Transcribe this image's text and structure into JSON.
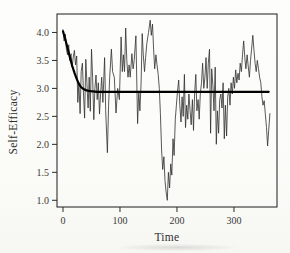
{
  "figure": {
    "xlabel": "Time",
    "ylabel": "Self-Efficacy"
  },
  "colors": {
    "background": "#fdfdfb",
    "frame": "#1d1d1d",
    "tick": "#2a2a2a",
    "text": "#3a3a3a",
    "observed_line": "#2e2e2e",
    "trend_line": "#000000"
  },
  "chart_data": {
    "type": "line",
    "title": "",
    "xlabel": "Time",
    "ylabel": "Self-Efficacy",
    "xlim": [
      -10.5,
      375.5
    ],
    "ylim": [
      0.88,
      4.33
    ],
    "grid": false,
    "legend": null,
    "x_ticks": [
      {
        "v": 0,
        "label": "0"
      },
      {
        "v": 100,
        "label": "100"
      },
      {
        "v": 200,
        "label": "200"
      },
      {
        "v": 300,
        "label": "300"
      }
    ],
    "y_ticks": [
      {
        "v": 1.0,
        "label": "1.0"
      },
      {
        "v": 1.5,
        "label": "1.5"
      },
      {
        "v": 2.0,
        "label": "2.0"
      },
      {
        "v": 2.5,
        "label": "2.5"
      },
      {
        "v": 3.0,
        "label": "3.0"
      },
      {
        "v": 3.5,
        "label": "3.5"
      },
      {
        "v": 4.0,
        "label": "4.0"
      }
    ],
    "series": [
      {
        "name": "observed-self-efficacy",
        "style": "thin-jagged",
        "color": "#2e2e2e",
        "width": 0.8,
        "points": [
          [
            0,
            4.05
          ],
          [
            2,
            3.85
          ],
          [
            4,
            3.97
          ],
          [
            6,
            3.7
          ],
          [
            8,
            3.6
          ],
          [
            10,
            3.78
          ],
          [
            12,
            3.5
          ],
          [
            14,
            3.62
          ],
          [
            16,
            3.38
          ],
          [
            18,
            3.55
          ],
          [
            20,
            3.68
          ],
          [
            22,
            3.42
          ],
          [
            24,
            3.58
          ],
          [
            26,
            2.75
          ],
          [
            28,
            3.1
          ],
          [
            30,
            2.55
          ],
          [
            32,
            3.3
          ],
          [
            34,
            3.45
          ],
          [
            36,
            2.9
          ],
          [
            38,
            2.47
          ],
          [
            40,
            3.52
          ],
          [
            42,
            3.1
          ],
          [
            44,
            2.65
          ],
          [
            46,
            3.2
          ],
          [
            48,
            2.59
          ],
          [
            50,
            3.7
          ],
          [
            52,
            3.2
          ],
          [
            54,
            2.44
          ],
          [
            56,
            3.0
          ],
          [
            58,
            3.24
          ],
          [
            60,
            2.8
          ],
          [
            62,
            3.1
          ],
          [
            64,
            2.54
          ],
          [
            66,
            2.9
          ],
          [
            68,
            3.2
          ],
          [
            70,
            2.75
          ],
          [
            73,
            3.55
          ],
          [
            75,
            2.6
          ],
          [
            78,
            1.85
          ],
          [
            80,
            2.7
          ],
          [
            82,
            3.2
          ],
          [
            85,
            3.7
          ],
          [
            87,
            3.3
          ],
          [
            90,
            3.2
          ],
          [
            93,
            2.56
          ],
          [
            96,
            3.0
          ],
          [
            99,
            2.8
          ],
          [
            102,
            3.92
          ],
          [
            104,
            3.3
          ],
          [
            106,
            3.6
          ],
          [
            108,
            3.3
          ],
          [
            110,
            4.08
          ],
          [
            112,
            3.5
          ],
          [
            114,
            3.2
          ],
          [
            116,
            3.42
          ],
          [
            118,
            3.2
          ],
          [
            121,
            3.62
          ],
          [
            123,
            3.35
          ],
          [
            125,
            3.5
          ],
          [
            128,
            3.94
          ],
          [
            131,
            2.37
          ],
          [
            133,
            2.95
          ],
          [
            135,
            2.6
          ],
          [
            137,
            3.1
          ],
          [
            139,
            3.98
          ],
          [
            141,
            3.6
          ],
          [
            143,
            3.3
          ],
          [
            145,
            3.55
          ],
          [
            147,
            3.8
          ],
          [
            150,
            4.0
          ],
          [
            153,
            4.22
          ],
          [
            155,
            3.95
          ],
          [
            157,
            4.15
          ],
          [
            159,
            3.7
          ],
          [
            161,
            3.35
          ],
          [
            163,
            3.6
          ],
          [
            165,
            3.42
          ],
          [
            167,
            3.25
          ],
          [
            169,
            3.0
          ],
          [
            171,
            2.55
          ],
          [
            173,
            1.9
          ],
          [
            175,
            1.55
          ],
          [
            177,
            1.78
          ],
          [
            179,
            1.35
          ],
          [
            181,
            1.15
          ],
          [
            183,
            1.0
          ],
          [
            185,
            1.5
          ],
          [
            187,
            1.22
          ],
          [
            189,
            1.65
          ],
          [
            191,
            1.45
          ],
          [
            193,
            2.1
          ],
          [
            195,
            1.8
          ],
          [
            197,
            2.45
          ],
          [
            199,
            2.7
          ],
          [
            201,
            2.95
          ],
          [
            203,
            3.15
          ],
          [
            205,
            2.7
          ],
          [
            207,
            2.4
          ],
          [
            209,
            2.85
          ],
          [
            211,
            2.5
          ],
          [
            213,
            3.25
          ],
          [
            215,
            2.3
          ],
          [
            217,
            2.7
          ],
          [
            219,
            2.45
          ],
          [
            221,
            2.9
          ],
          [
            223,
            2.6
          ],
          [
            225,
            2.35
          ],
          [
            227,
            2.8
          ],
          [
            229,
            2.25
          ],
          [
            231,
            2.9
          ],
          [
            233,
            3.25
          ],
          [
            235,
            2.6
          ],
          [
            237,
            2.8
          ],
          [
            239,
            2.45
          ],
          [
            241,
            2.9
          ],
          [
            243,
            3.1
          ],
          [
            245,
            3.45
          ],
          [
            247,
            3.0
          ],
          [
            249,
            3.2
          ],
          [
            251,
            3.55
          ],
          [
            253,
            3.0
          ],
          [
            255,
            3.45
          ],
          [
            257,
            3.7
          ],
          [
            259,
            2.2
          ],
          [
            261,
            3.35
          ],
          [
            263,
            3.05
          ],
          [
            265,
            2.6
          ],
          [
            267,
            3.38
          ],
          [
            269,
            2.0
          ],
          [
            271,
            2.6
          ],
          [
            273,
            2.2
          ],
          [
            275,
            2.8
          ],
          [
            277,
            2.9
          ],
          [
            279,
            2.65
          ],
          [
            281,
            3.1
          ],
          [
            283,
            2.1
          ],
          [
            285,
            2.7
          ],
          [
            287,
            2.15
          ],
          [
            289,
            2.85
          ],
          [
            291,
            3.0
          ],
          [
            293,
            2.7
          ],
          [
            295,
            3.1
          ],
          [
            297,
            2.9
          ],
          [
            299,
            3.2
          ],
          [
            301,
            3.0
          ],
          [
            303,
            3.33
          ],
          [
            305,
            3.1
          ],
          [
            307,
            3.27
          ],
          [
            309,
            3.15
          ],
          [
            311,
            3.45
          ],
          [
            313,
            3.3
          ],
          [
            315,
            3.6
          ],
          [
            317,
            3.85
          ],
          [
            319,
            3.55
          ],
          [
            321,
            3.35
          ],
          [
            323,
            3.6
          ],
          [
            325,
            3.4
          ],
          [
            327,
            3.2
          ],
          [
            329,
            3.5
          ],
          [
            331,
            3.7
          ],
          [
            333,
            3.95
          ],
          [
            335,
            3.7
          ],
          [
            337,
            3.45
          ],
          [
            339,
            3.3
          ],
          [
            341,
            3.5
          ],
          [
            343,
            3.35
          ],
          [
            345,
            3.2
          ],
          [
            347,
            3.1
          ],
          [
            349,
            2.85
          ],
          [
            351,
            2.7
          ],
          [
            353,
            2.78
          ],
          [
            355,
            2.55
          ],
          [
            357,
            2.3
          ],
          [
            359,
            1.97
          ],
          [
            361,
            2.25
          ],
          [
            363,
            2.55
          ]
        ]
      },
      {
        "name": "fitted-trend",
        "style": "thick-smooth",
        "color": "#000000",
        "width": 2.2,
        "points": [
          [
            0,
            4.02
          ],
          [
            4,
            3.88
          ],
          [
            8,
            3.72
          ],
          [
            12,
            3.56
          ],
          [
            16,
            3.41
          ],
          [
            20,
            3.28
          ],
          [
            24,
            3.17
          ],
          [
            28,
            3.08
          ],
          [
            32,
            3.02
          ],
          [
            36,
            2.99
          ],
          [
            40,
            2.97
          ],
          [
            48,
            2.95
          ],
          [
            60,
            2.94
          ],
          [
            90,
            2.94
          ],
          [
            130,
            2.94
          ],
          [
            170,
            2.94
          ],
          [
            210,
            2.94
          ],
          [
            250,
            2.94
          ],
          [
            290,
            2.94
          ],
          [
            330,
            2.94
          ],
          [
            361,
            2.94
          ]
        ]
      }
    ]
  }
}
